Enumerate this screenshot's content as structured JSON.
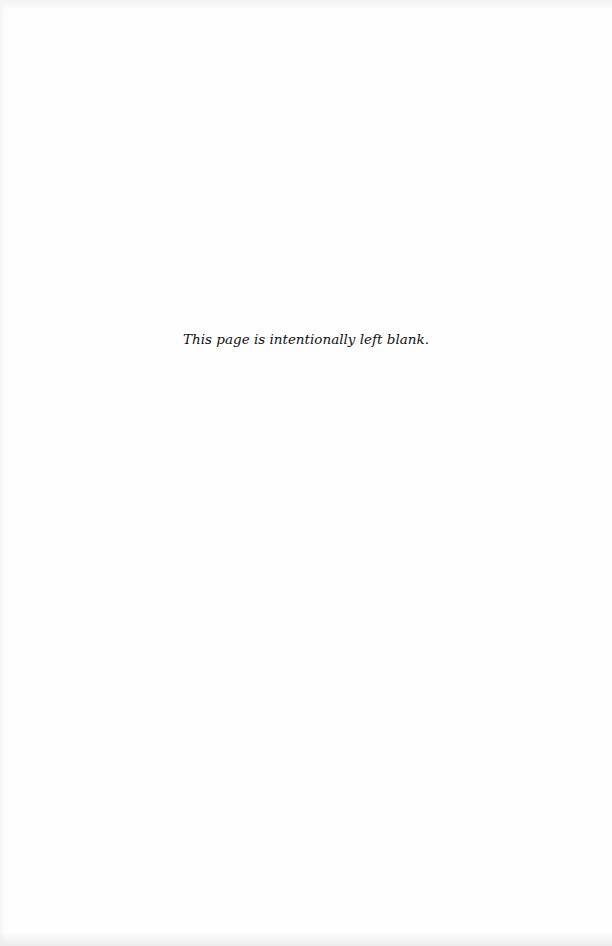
{
  "page": {
    "notice_text": "This page is intentionally left blank.",
    "colors": {
      "background": "#ffffff",
      "text": "#111111"
    }
  }
}
